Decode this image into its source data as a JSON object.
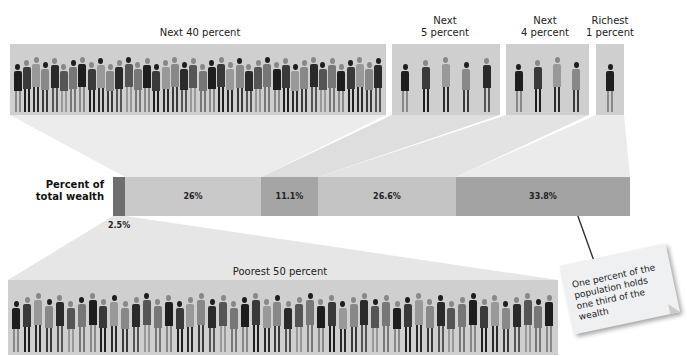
{
  "y_label": "Percent of\ntotal wealth",
  "groups": {
    "next40": {
      "label": "Next 40 percent"
    },
    "next5": {
      "label_line1": "Next",
      "label_line2": "5 percent"
    },
    "next4": {
      "label_line1": "Next",
      "label_line2": "4 percent"
    },
    "richest1": {
      "label_line1": "Richest",
      "label_line2": "1 percent"
    },
    "poorest50": {
      "label": "Poorest 50 percent"
    }
  },
  "segments": [
    {
      "group": "Poorest 50 percent",
      "value_label": "2.5%",
      "color": "#6e6e6e"
    },
    {
      "group": "Next 40 percent",
      "value_label": "26%",
      "color": "#c9c9c9"
    },
    {
      "group": "Next 5 percent",
      "value_label": "11.1%",
      "color": "#a5a5a5"
    },
    {
      "group": "Next 4 percent",
      "value_label": "26.6%",
      "color": "#c4c4c4"
    },
    {
      "group": "Richest 1 percent",
      "value_label": "33.8%",
      "color": "#a3a3a3"
    }
  ],
  "annotation": {
    "text": "One percent of the population holds one third of the wealth"
  },
  "chart_data": {
    "type": "bar",
    "orientation": "horizontal-stacked",
    "title": "",
    "ylabel": "Percent of total wealth",
    "categories": [
      "Poorest 50 percent",
      "Next 40 percent",
      "Next 5 percent",
      "Next 4 percent",
      "Richest 1 percent"
    ],
    "values": [
      2.5,
      26,
      11.1,
      26.6,
      33.8
    ],
    "value_labels": [
      "2.5%",
      "26%",
      "11.1%",
      "26.6%",
      "33.8%"
    ],
    "annotations": [
      "One percent of the population holds one third of the wealth"
    ]
  }
}
